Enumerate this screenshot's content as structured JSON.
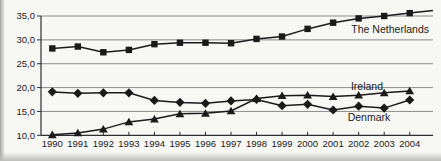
{
  "figure": {
    "background_color": "#f7f7f4",
    "ink_color": "#1a1a1a",
    "gridline_color": "#8c8c8c"
  },
  "chart_data": {
    "type": "line",
    "title": "",
    "xlabel": "",
    "ylabel": "",
    "grid": true,
    "legend_position": "inline-labels",
    "categories": [
      "1990",
      "1991",
      "1992",
      "1993",
      "1994",
      "1995",
      "1996",
      "1997",
      "1998",
      "1999",
      "2000",
      "2001",
      "2002",
      "2003",
      "2004"
    ],
    "ylim": [
      10,
      35
    ],
    "yticks": {
      "values": [
        35,
        30,
        25,
        20,
        15,
        10
      ],
      "labels": [
        "35,0",
        "30,0",
        "25,0",
        "20,0",
        "15,0",
        "10,0"
      ]
    },
    "series": [
      {
        "name": "The Netherlands",
        "marker": "square",
        "color": "#1a1a1a",
        "extend_to_edge": true,
        "values": [
          28.2,
          28.6,
          27.4,
          27.9,
          29.1,
          29.4,
          29.4,
          29.3,
          30.2,
          30.7,
          32.3,
          33.6,
          34.5,
          35.0,
          35.6
        ]
      },
      {
        "name": "Ireland",
        "marker": "triangle",
        "color": "#1a1a1a",
        "extend_to_edge": false,
        "values": [
          10.1,
          10.5,
          11.3,
          12.8,
          13.4,
          14.5,
          14.6,
          15.1,
          17.7,
          18.3,
          18.4,
          18.1,
          18.4,
          18.9,
          19.3
        ]
      },
      {
        "name": "Denmark",
        "marker": "diamond",
        "color": "#1a1a1a",
        "extend_to_edge": false,
        "values": [
          19.1,
          18.8,
          18.9,
          18.9,
          17.3,
          16.9,
          16.7,
          17.2,
          17.5,
          16.2,
          16.5,
          15.3,
          16.1,
          15.7,
          17.4
        ]
      }
    ]
  }
}
